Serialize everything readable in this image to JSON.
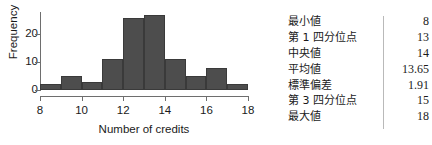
{
  "chart_data": {
    "type": "bar",
    "title": "",
    "xlabel": "Number of credits",
    "ylabel": "Frequency",
    "categories": [
      "8-9",
      "9-10",
      "10-11",
      "11-12",
      "12-13",
      "13-14",
      "14-15",
      "15-16",
      "16-17",
      "17-18"
    ],
    "bin_edges": [
      8,
      9,
      10,
      11,
      12,
      13,
      14,
      15,
      16,
      17,
      18
    ],
    "values": [
      2,
      5,
      3,
      11,
      26,
      27,
      11,
      5,
      8,
      2
    ],
    "xlim": [
      8,
      18
    ],
    "ylim": [
      0,
      28
    ],
    "xticks": [
      8,
      10,
      12,
      14,
      16,
      18
    ],
    "yticks": [
      0,
      10,
      20
    ],
    "grid": false,
    "legend": null,
    "bar_color": "#4d4d4d",
    "bar_edge_color": "#3a3a3a",
    "axis_color": "#6e6e6e"
  },
  "stats_table": {
    "rule_color": "#b9b9b9",
    "rows": [
      {
        "label": "最小値",
        "value": "8"
      },
      {
        "label": "第 1 四分位点",
        "value": "13"
      },
      {
        "label": "中央値",
        "value": "14"
      },
      {
        "label": "平均値",
        "value": "13.65"
      },
      {
        "label": "標準偏差",
        "value": "1.91"
      },
      {
        "label": "第 3 四分位点",
        "value": "15"
      },
      {
        "label": "最大値",
        "value": "18"
      }
    ]
  }
}
